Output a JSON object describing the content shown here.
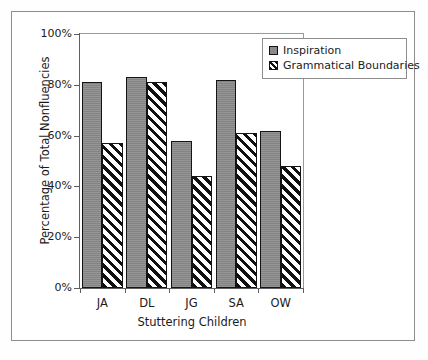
{
  "chart_data": {
    "type": "bar",
    "title": "",
    "subtitle": "",
    "xlabel": "Stuttering Children",
    "ylabel": "Percentage of Total Nonfluencies",
    "categories": [
      "JA",
      "DL",
      "JG",
      "SA",
      "OW"
    ],
    "series": [
      {
        "name": "Inspiration",
        "values": [
          81,
          83,
          58,
          82,
          62
        ]
      },
      {
        "name": "Grammatical Boundaries",
        "values": [
          57,
          81,
          44,
          61,
          48
        ]
      }
    ],
    "ylim": [
      0,
      100
    ],
    "ytick_values": [
      0,
      20,
      40,
      60,
      80,
      100
    ],
    "ytick_labels": [
      "0%",
      "20%",
      "40%",
      "60%",
      "80%",
      "100%"
    ],
    "grid": false,
    "legend_position": "top-right",
    "legend_entries": [
      "Inspiration",
      "Grammatical Boundaries"
    ],
    "annotations": []
  },
  "style": {
    "series_0_color": "#8a8a8a",
    "series_1_color": "#ffffff",
    "series_1_hatch": "forward-diagonal",
    "axis_color": "#5f5f5f",
    "frame_color": "#8d8d8d",
    "text_color": "#1b1b1b",
    "background": "#ffffff"
  }
}
